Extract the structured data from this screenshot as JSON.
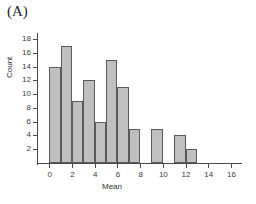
{
  "panel": {
    "label": "(A)"
  },
  "chart_data": {
    "type": "bar",
    "title": "",
    "subtitle": "",
    "xlabel": "Mean",
    "ylabel": "Count",
    "xlim": [
      -1,
      16.8
    ],
    "ylim": [
      0,
      18.6
    ],
    "xticks": [
      0,
      2,
      4,
      6,
      8,
      10,
      12,
      14,
      16
    ],
    "yticks": [
      2,
      4,
      6,
      8,
      10,
      12,
      14,
      16,
      18
    ],
    "xtick_labels": [
      "0",
      "2",
      "4",
      "6",
      "8",
      "10",
      "12",
      "14",
      "16"
    ],
    "ytick_labels": [
      "2",
      "4",
      "6",
      "8",
      "10",
      "12",
      "14",
      "16",
      "18"
    ],
    "grid": false,
    "legend": null,
    "bin_width": 1,
    "bin_starts": [
      0,
      1,
      2,
      3,
      4,
      5,
      6,
      7,
      8,
      9,
      10,
      11,
      12
    ],
    "categories": [
      "0-1",
      "1-2",
      "2-3",
      "3-4",
      "4-5",
      "5-6",
      "6-7",
      "7-8",
      "8-9",
      "9-10",
      "10-11",
      "11-12",
      "12-13"
    ],
    "values": [
      14,
      17,
      9,
      12,
      6,
      15,
      11,
      5,
      0,
      5,
      0,
      4,
      2
    ],
    "bar_fill": "#bfbfbf",
    "bar_edge": "#5a5a5a",
    "axis_color": "#4a4a4a",
    "background": "#ffffff"
  }
}
